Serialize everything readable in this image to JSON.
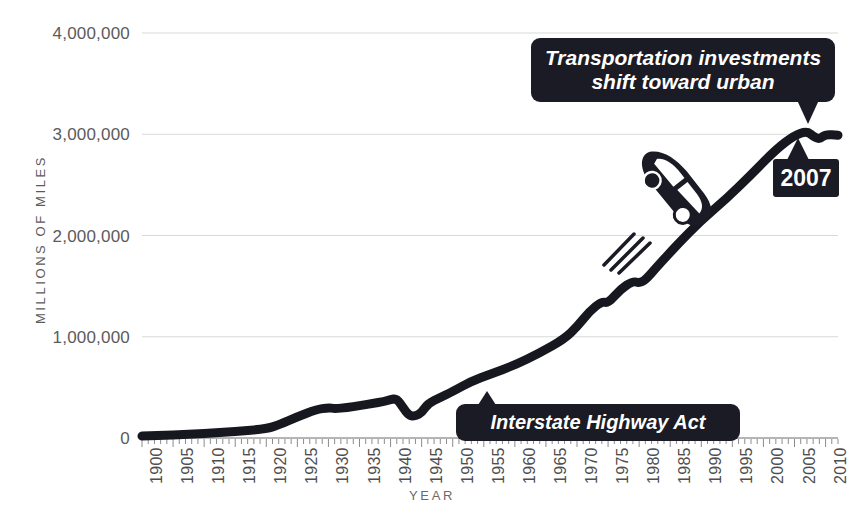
{
  "chart_data": {
    "type": "line",
    "title": "",
    "xlabel": "YEAR",
    "ylabel": "MILLIONS OF MILES",
    "xlim": [
      1900,
      2012
    ],
    "ylim": [
      0,
      4000000
    ],
    "grid": true,
    "legend": "none",
    "y_ticks": [
      "4,000,000",
      "3,000,000",
      "2,000,000",
      "1,000,000",
      "0"
    ],
    "y_tick_values": [
      4000000,
      3000000,
      2000000,
      1000000,
      0
    ],
    "x_ticks": [
      "1900",
      "1905",
      "1910",
      "1915",
      "1920",
      "1925",
      "1930",
      "1935",
      "1940",
      "1945",
      "1950",
      "1955",
      "1960",
      "1965",
      "1970",
      "1975",
      "1980",
      "1985",
      "1990",
      "1995",
      "2000",
      "2005",
      "2010"
    ],
    "x_tick_values": [
      1900,
      1905,
      1910,
      1915,
      1920,
      1925,
      1930,
      1935,
      1940,
      1945,
      1950,
      1955,
      1960,
      1965,
      1970,
      1975,
      1980,
      1985,
      1990,
      1995,
      2000,
      2005,
      2010
    ],
    "minor_tick_step": 1,
    "series": [
      {
        "name": "Vehicle miles traveled",
        "color": "#171720",
        "x": [
          1900,
          1905,
          1910,
          1915,
          1920,
          1922,
          1925,
          1928,
          1930,
          1931,
          1933,
          1935,
          1937,
          1939,
          1940,
          1941,
          1942,
          1943,
          1944,
          1945,
          1946,
          1948,
          1950,
          1953,
          1956,
          1960,
          1964,
          1968,
          1970,
          1972,
          1974,
          1975,
          1977,
          1979,
          1980,
          1981,
          1983,
          1986,
          1990,
          1994,
          1998,
          2002,
          2005,
          2007,
          2008,
          2009,
          2010,
          2012
        ],
        "y": [
          20000,
          30000,
          45000,
          65000,
          90000,
          130000,
          210000,
          280000,
          300000,
          290000,
          300000,
          320000,
          340000,
          360000,
          380000,
          390000,
          300000,
          220000,
          215000,
          250000,
          340000,
          400000,
          460000,
          560000,
          630000,
          720000,
          840000,
          980000,
          1100000,
          1250000,
          1350000,
          1330000,
          1470000,
          1550000,
          1530000,
          1560000,
          1700000,
          1900000,
          2150000,
          2360000,
          2600000,
          2850000,
          2990000,
          3030000,
          2980000,
          2950000,
          3000000,
          2990000
        ]
      }
    ],
    "annotations": [
      {
        "id": "urban",
        "text": "Transportation investments shift toward urban",
        "line1": "Transportation investments",
        "line2": "shift toward urban",
        "points_to_year": 2008
      },
      {
        "id": "interstate",
        "text": "Interstate Highway Act",
        "points_to_year": 1956
      },
      {
        "id": "year-2007",
        "text": "2007",
        "points_to_year": 2007
      }
    ],
    "decorations": [
      {
        "id": "car-illustration",
        "label": "car-icon",
        "along_year": 1993,
        "color": "#1b1b25"
      }
    ],
    "gridline_color": "#d9d9d9",
    "axis_color": "#6a6a6a",
    "background": "#ffffff"
  }
}
